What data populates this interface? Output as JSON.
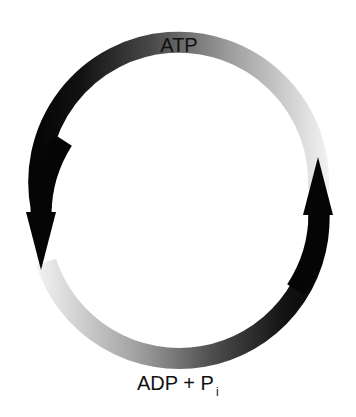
{
  "diagram": {
    "top_label": "ATP",
    "bottom_label_main": "ADP + P",
    "bottom_label_subscript": "i",
    "colors": {
      "dark": "#050505",
      "light": "#f2f2f2",
      "text": "#111111"
    },
    "arrows": [
      {
        "name": "left-arrow",
        "direction": "down",
        "description": "ATP hydrolysis toward ADP + Pi"
      },
      {
        "name": "right-arrow",
        "direction": "up",
        "description": "ADP + Pi regenerated to ATP"
      }
    ]
  }
}
